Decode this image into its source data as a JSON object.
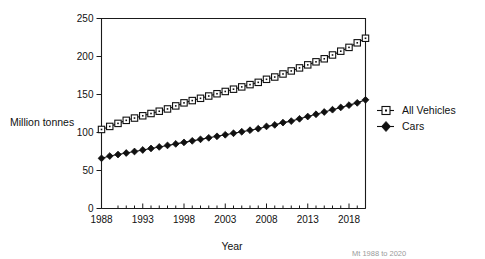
{
  "chart_data": {
    "type": "line",
    "title": "",
    "xlabel": "Year",
    "ylabel": "Million tonnes",
    "xlim": [
      1988,
      2020
    ],
    "ylim": [
      0,
      250
    ],
    "grid": false,
    "legend_position": "right",
    "x": [
      1988,
      1989,
      1990,
      1991,
      1992,
      1993,
      1994,
      1995,
      1996,
      1997,
      1998,
      1999,
      2000,
      2001,
      2002,
      2003,
      2004,
      2005,
      2006,
      2007,
      2008,
      2009,
      2010,
      2011,
      2012,
      2013,
      2014,
      2015,
      2016,
      2017,
      2018,
      2019,
      2020
    ],
    "xtick_values": [
      1988,
      1993,
      1998,
      2003,
      2008,
      2013,
      2018
    ],
    "xtick_labels": [
      "1988",
      "1993",
      "1998",
      "2003",
      "2008",
      "2013",
      "2018"
    ],
    "xtick_minor_values": [
      1990,
      1991,
      1992,
      1994,
      1995,
      1996,
      1997,
      1999,
      2000,
      2001,
      2002,
      2004,
      2005,
      2006,
      2007,
      2009,
      2010,
      2011,
      2012,
      2014,
      2015,
      2016,
      2017,
      2019,
      2020
    ],
    "ytick_values": [
      0,
      50,
      100,
      150,
      200,
      250
    ],
    "ytick_labels": [
      "0",
      "50",
      "100",
      "150",
      "200",
      "250"
    ],
    "series": [
      {
        "name": "All Vehicles",
        "marker": "open-square",
        "values": [
          104,
          108,
          112,
          116,
          119,
          122,
          125,
          128,
          131,
          135,
          139,
          142,
          145,
          148,
          151,
          154,
          157,
          160,
          163,
          166,
          170,
          173,
          177,
          181,
          185,
          189,
          193,
          197,
          202,
          207,
          212,
          218,
          224
        ]
      },
      {
        "name": "Cars",
        "marker": "filled-diamond",
        "values": [
          66,
          69,
          71,
          73,
          75,
          77,
          79,
          81,
          83,
          85,
          87,
          89,
          91,
          93,
          95,
          97,
          99,
          101,
          103,
          105,
          108,
          110,
          113,
          115,
          118,
          121,
          124,
          127,
          130,
          133,
          136,
          139,
          143
        ]
      }
    ]
  },
  "legend": {
    "items": [
      {
        "label": "All Vehicles"
      },
      {
        "label": "Cars"
      }
    ]
  },
  "footnote": {
    "text": "Mt  1988 to 2020"
  }
}
